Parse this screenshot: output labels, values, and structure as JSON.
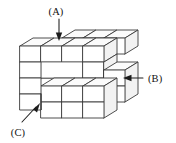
{
  "figure": {
    "kind": "isometric-cube-stack-diagram",
    "width": 176,
    "height": 143,
    "background_color": "#ffffff",
    "line_color": "#3a3a3a",
    "arrow_color": "#1c1c1c",
    "top_face_color": "#fbfbfb",
    "side_face_color": "#f2f2f2",
    "front_face_color": "#ffffff"
  },
  "callouts": [
    {
      "id": "A",
      "label": "(A)",
      "label_x": 56,
      "label_y": 15,
      "arrow_direction": "down",
      "description": "points down to the top face of the upper block layer"
    },
    {
      "id": "B",
      "label": "(B)",
      "label_x": 152,
      "label_y": 78,
      "arrow_direction": "left",
      "description": "points left to the right-hand protruding column"
    },
    {
      "id": "C",
      "label": "(C)",
      "label_x": 18,
      "label_y": 134,
      "arrow_direction": "up-right",
      "description": "points up-right to the lower front block"
    }
  ]
}
